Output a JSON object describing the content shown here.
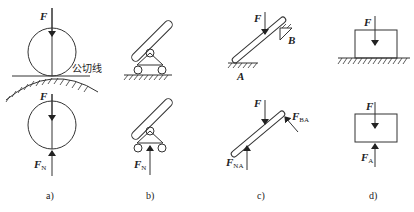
{
  "figure": {
    "panels": [
      {
        "id": "a",
        "caption": "a)",
        "top": {
          "force_label": "F",
          "tangent_label": "公切线",
          "description": "disk on curved surface with common tangent line"
        },
        "bottom": {
          "force_labels": {
            "applied": "F",
            "normal": "F",
            "normal_sub": "N"
          },
          "description": "free-body diagram of disk"
        }
      },
      {
        "id": "b",
        "caption": "b)",
        "top": {
          "description": "bar pinned to roller support on ground"
        },
        "bottom": {
          "force_labels": {
            "normal": "F",
            "normal_sub": "N"
          },
          "description": "free-body diagram with roller reaction"
        }
      },
      {
        "id": "c",
        "caption": "c)",
        "top": {
          "force_label": "F",
          "point_a": "A",
          "point_b": "B",
          "description": "inclined bar resting on ground at A and corner B"
        },
        "bottom": {
          "force_labels": {
            "applied": "F",
            "reaction_a": "F",
            "reaction_a_sub": "NA",
            "reaction_b": "F",
            "reaction_b_sub": "BA"
          },
          "description": "free-body diagram of inclined bar"
        }
      },
      {
        "id": "d",
        "caption": "d)",
        "top": {
          "force_label": "F",
          "description": "block on ground"
        },
        "bottom": {
          "force_labels": {
            "applied": "F",
            "reaction": "F",
            "reaction_sub": "A"
          },
          "description": "free-body diagram of block"
        }
      }
    ]
  }
}
